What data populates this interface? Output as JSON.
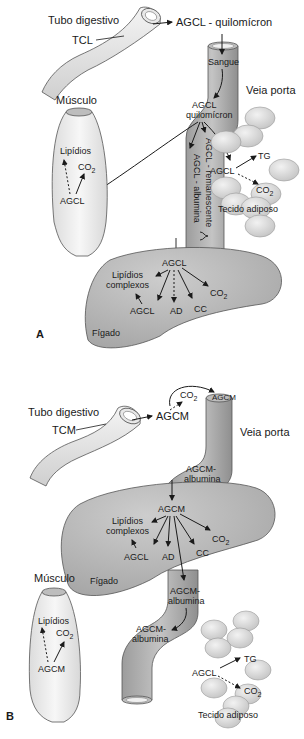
{
  "panel_a": {
    "letter": "A",
    "gut": {
      "label": "Tubo digestivo",
      "substrate": "TCL"
    },
    "gut_output": "AGCL - quilomícron",
    "vein": {
      "label": "Veia porta",
      "blood": "Sangue",
      "carrier_line1": "AGCL",
      "carrier_line2": "quilomícron",
      "branch_remnant": "AGCL - remanescente",
      "branch_albumin": "AGCL - albumina"
    },
    "muscle": {
      "label": "Músculo",
      "lipids": "Lipídios",
      "co2": "CO",
      "co2_sub": "2",
      "source": "AGCL"
    },
    "adipose": {
      "label": "Tecido adiposo",
      "source": "AGCL",
      "tg": "TG",
      "co2": "CO",
      "co2_sub": "2"
    },
    "liver": {
      "label": "Fígado",
      "source": "AGCL",
      "lipids_line1": "Lipídios",
      "lipids_line2": "complexos",
      "agcl": "AGCL",
      "ad": "AD",
      "cc": "CC",
      "co2": "CO",
      "co2_sub": "2"
    }
  },
  "panel_b": {
    "letter": "B",
    "gut": {
      "label": "Tubo digestivo",
      "substrate": "TCM"
    },
    "gut_output": "AGCM",
    "oxidation": {
      "co2": "CO",
      "co2_sub": "2"
    },
    "vein": {
      "label": "Veia porta",
      "opening_text": "AGCM",
      "carrier_line1": "AGCM-",
      "carrier_line2": "albumina"
    },
    "liver": {
      "label": "Fígado",
      "source": "AGCM",
      "lipids_line1": "Lipídios",
      "lipids_line2": "complexos",
      "agcl": "AGCL",
      "ad": "AD",
      "cc": "CC",
      "co2": "CO",
      "co2_sub": "2"
    },
    "outflow": {
      "line1_a": "AGCM-",
      "line2_a": "albumina",
      "line1_b": "AGCM-",
      "line2_b": "albumina"
    },
    "muscle": {
      "label": "Músculo",
      "lipids": "Lipídios",
      "co2": "CO",
      "co2_sub": "2",
      "source": "AGCM"
    },
    "adipose": {
      "label": "Tecido adiposo",
      "source": "AGCL",
      "tg": "TG",
      "co2": "CO",
      "co2_sub": "2"
    }
  },
  "colors": {
    "vein": "#a9a9a9",
    "vein_light": "#cfcfcf",
    "liver": "#b9b9b9",
    "gut": "#e6e6e6",
    "muscle": "#efefef",
    "fat": "#d9d9d9",
    "ink": "#1a1a1a"
  }
}
